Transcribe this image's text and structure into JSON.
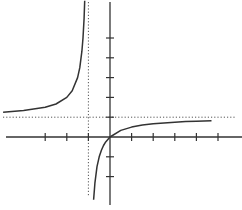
{
  "chart_data": {
    "type": "line",
    "title": "",
    "xlabel": "",
    "ylabel": "",
    "function": "y = x / (x + 1)",
    "xlim": [
      -5.1,
      6.0
    ],
    "ylim": [
      -3.3,
      7.0
    ],
    "grid": false,
    "x_ticks": [
      -3,
      -2,
      -1,
      1,
      2,
      3,
      4,
      5
    ],
    "y_ticks": [
      -2,
      -1,
      1,
      2,
      3,
      4,
      5
    ],
    "asymptotes": {
      "vertical_x": -1,
      "horizontal_y": 1
    },
    "series": [
      {
        "name": "left branch",
        "x": [
          -4.95,
          -4,
          -3,
          -2.5,
          -2,
          -1.75,
          -1.5,
          -1.4,
          -1.3,
          -1.25,
          -1.2,
          -1.17
        ],
        "y": [
          1.25,
          1.333,
          1.5,
          1.667,
          2,
          2.333,
          3,
          3.5,
          4.333,
          5,
          6,
          6.88
        ]
      },
      {
        "name": "right branch",
        "x": [
          -0.76,
          -0.7,
          -0.6,
          -0.5,
          -0.4,
          -0.3,
          -0.2,
          0,
          0.5,
          1,
          1.5,
          2,
          2.5,
          3,
          3.5,
          4,
          4.7
        ],
        "y": [
          -3.17,
          -2.333,
          -1.5,
          -1,
          -0.667,
          -0.429,
          -0.25,
          0,
          0.333,
          0.5,
          0.6,
          0.667,
          0.714,
          0.75,
          0.778,
          0.8,
          0.825
        ]
      }
    ]
  },
  "colors": {
    "axis": "#333333",
    "curve": "#333333",
    "asymptote": "#555555",
    "background": "#ffffff"
  }
}
